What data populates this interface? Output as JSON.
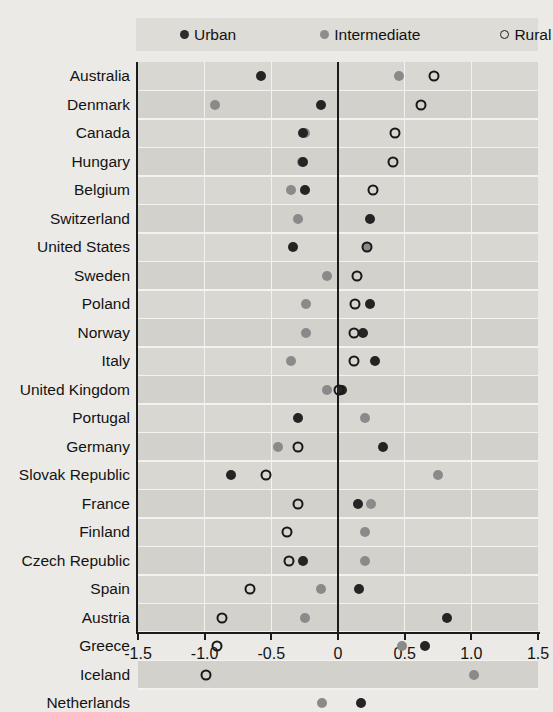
{
  "legend": {
    "items": [
      {
        "label": "Urban",
        "marker": "filled-dark-circle-icon",
        "color": "#242424"
      },
      {
        "label": "Intermediate",
        "marker": "filled-grey-circle-icon",
        "color": "#8a8a8a"
      },
      {
        "label": "Rural",
        "marker": "open-circle-icon",
        "color": "#181818"
      }
    ]
  },
  "chart_data": {
    "type": "scatter",
    "title": "",
    "xlabel": "",
    "ylabel": "",
    "xlim": [
      -1.5,
      1.5
    ],
    "xticks": [
      -1.5,
      -1.0,
      -0.5,
      0,
      0.5,
      1.0,
      1.5
    ],
    "xtick_labels": [
      "-1.5",
      "-1.0",
      "-0.5",
      "0",
      "0.5",
      "1.0",
      "1.5"
    ],
    "grid": true,
    "legend_position": "top",
    "series_names": [
      "Urban",
      "Intermediate",
      "Rural"
    ],
    "categories": [
      "Australia",
      "Denmark",
      "Canada",
      "Hungary",
      "Belgium",
      "Switzerland",
      "United States",
      "Sweden",
      "Poland",
      "Norway",
      "Italy",
      "United Kingdom",
      "Portugal",
      "Germany",
      "Slovak Republic",
      "France",
      "Finland",
      "Czech Republic",
      "Spain",
      "Austria",
      "Greece",
      "Iceland",
      "Netherlands"
    ],
    "series": [
      {
        "name": "Urban",
        "values": [
          -0.58,
          -0.13,
          -0.26,
          -0.26,
          -0.25,
          0.24,
          -0.34,
          null,
          0.24,
          0.19,
          0.28,
          0.03,
          -0.3,
          0.34,
          -0.8,
          0.15,
          null,
          -0.26,
          0.16,
          0.82,
          0.65,
          null,
          0.17
        ]
      },
      {
        "name": "Intermediate",
        "values": [
          0.46,
          -0.92,
          -0.25,
          -0.27,
          -0.35,
          -0.3,
          0.22,
          -0.08,
          -0.24,
          -0.24,
          -0.35,
          -0.08,
          0.2,
          -0.45,
          0.75,
          0.25,
          0.2,
          0.2,
          -0.13,
          -0.25,
          0.48,
          1.02,
          -0.12
        ]
      },
      {
        "name": "Rural",
        "values": [
          0.72,
          0.62,
          0.43,
          0.41,
          0.26,
          null,
          0.22,
          0.14,
          0.13,
          0.12,
          0.12,
          0.01,
          null,
          -0.3,
          -0.54,
          -0.3,
          -0.38,
          -0.37,
          -0.66,
          -0.87,
          -0.91,
          -0.99,
          null
        ]
      }
    ]
  }
}
